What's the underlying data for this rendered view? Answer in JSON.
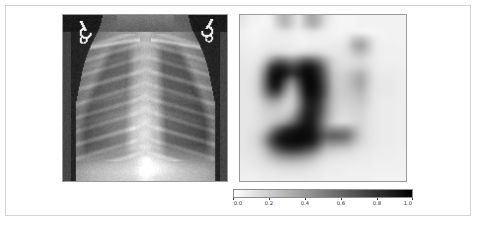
{
  "figure": {
    "background_color": "#ffffff",
    "frame_color": "#d3d3d3",
    "width": 477,
    "height": 226
  },
  "panels": {
    "left": {
      "name": "chest-xray-image",
      "kind": "grayscale-radiograph",
      "description": "Pediatric frontal chest radiograph showing rib cage, lungs and mediastinum with two metallic ECG lead clips at the upper corners",
      "border_color": "#9a9a9a"
    },
    "right": {
      "name": "saliency-heatmap-image",
      "kind": "low-resolution-grayscale-heatmap",
      "description": "Coarse pixelated attribution / saliency map overlaying the chest region, dark pixels indicate high attribution",
      "border_color": "#9a9a9a"
    }
  },
  "chart_data": {
    "type": "heatmap",
    "title": "",
    "xlabel": "",
    "ylabel": "",
    "colormap": "gray_r",
    "colormap_low_color": "#ffffff",
    "colormap_high_color": "#000000",
    "vmin": 0.0,
    "vmax": 1.0,
    "grid": false,
    "legend_position": "below-right-panel",
    "colorbar": {
      "orientation": "horizontal",
      "ticks": [
        0.0,
        0.2,
        0.4,
        0.6,
        0.8,
        1.0
      ],
      "tick_labels": [
        "0.0",
        "0.2",
        "0.4",
        "0.6",
        "0.8",
        "1.0"
      ],
      "label": ""
    },
    "heatmap_grid_size": [
      24,
      24
    ],
    "heatmap_values": [
      [
        0.1,
        0.06,
        0.05,
        0.04,
        0.07,
        0.22,
        0.3,
        0.2,
        0.1,
        0.25,
        0.34,
        0.26,
        0.12,
        0.06,
        0.04,
        0.04,
        0.04,
        0.05,
        0.05,
        0.05,
        0.05,
        0.05,
        0.05,
        0.05
      ],
      [
        0.08,
        0.05,
        0.04,
        0.04,
        0.06,
        0.18,
        0.26,
        0.18,
        0.1,
        0.22,
        0.3,
        0.22,
        0.1,
        0.05,
        0.04,
        0.04,
        0.04,
        0.05,
        0.05,
        0.05,
        0.05,
        0.05,
        0.05,
        0.05
      ],
      [
        0.06,
        0.04,
        0.04,
        0.05,
        0.06,
        0.08,
        0.1,
        0.08,
        0.06,
        0.08,
        0.1,
        0.08,
        0.06,
        0.05,
        0.04,
        0.05,
        0.06,
        0.05,
        0.04,
        0.04,
        0.04,
        0.05,
        0.05,
        0.05
      ],
      [
        0.06,
        0.05,
        0.05,
        0.06,
        0.07,
        0.07,
        0.07,
        0.06,
        0.05,
        0.05,
        0.06,
        0.06,
        0.06,
        0.06,
        0.06,
        0.1,
        0.22,
        0.26,
        0.18,
        0.08,
        0.05,
        0.05,
        0.05,
        0.05
      ],
      [
        0.07,
        0.06,
        0.06,
        0.07,
        0.08,
        0.08,
        0.08,
        0.07,
        0.06,
        0.06,
        0.07,
        0.07,
        0.07,
        0.08,
        0.09,
        0.14,
        0.3,
        0.36,
        0.24,
        0.1,
        0.06,
        0.06,
        0.06,
        0.05
      ],
      [
        0.08,
        0.07,
        0.07,
        0.1,
        0.14,
        0.16,
        0.14,
        0.12,
        0.14,
        0.18,
        0.18,
        0.16,
        0.12,
        0.1,
        0.1,
        0.12,
        0.22,
        0.26,
        0.18,
        0.09,
        0.06,
        0.06,
        0.06,
        0.06
      ],
      [
        0.09,
        0.08,
        0.1,
        0.2,
        0.4,
        0.54,
        0.52,
        0.46,
        0.52,
        0.62,
        0.6,
        0.48,
        0.3,
        0.16,
        0.12,
        0.12,
        0.14,
        0.16,
        0.12,
        0.08,
        0.06,
        0.06,
        0.06,
        0.06
      ],
      [
        0.09,
        0.09,
        0.14,
        0.36,
        0.72,
        0.86,
        0.82,
        0.74,
        0.8,
        0.9,
        0.88,
        0.72,
        0.44,
        0.2,
        0.14,
        0.14,
        0.16,
        0.18,
        0.14,
        0.09,
        0.07,
        0.07,
        0.07,
        0.06
      ],
      [
        0.1,
        0.1,
        0.18,
        0.48,
        0.86,
        0.95,
        0.9,
        0.8,
        0.88,
        0.96,
        0.94,
        0.8,
        0.52,
        0.24,
        0.18,
        0.2,
        0.26,
        0.3,
        0.2,
        0.1,
        0.08,
        0.08,
        0.08,
        0.07
      ],
      [
        0.1,
        0.11,
        0.2,
        0.52,
        0.88,
        0.94,
        0.72,
        0.52,
        0.74,
        0.95,
        0.96,
        0.84,
        0.56,
        0.26,
        0.2,
        0.22,
        0.3,
        0.34,
        0.22,
        0.11,
        0.09,
        0.09,
        0.08,
        0.07
      ],
      [
        0.1,
        0.11,
        0.2,
        0.5,
        0.82,
        0.86,
        0.54,
        0.34,
        0.62,
        0.92,
        0.96,
        0.86,
        0.58,
        0.28,
        0.2,
        0.22,
        0.28,
        0.32,
        0.2,
        0.11,
        0.09,
        0.09,
        0.08,
        0.07
      ],
      [
        0.1,
        0.11,
        0.18,
        0.4,
        0.62,
        0.62,
        0.36,
        0.24,
        0.52,
        0.88,
        0.94,
        0.84,
        0.56,
        0.28,
        0.2,
        0.2,
        0.24,
        0.26,
        0.18,
        0.1,
        0.09,
        0.09,
        0.08,
        0.07
      ],
      [
        0.1,
        0.1,
        0.14,
        0.26,
        0.36,
        0.34,
        0.22,
        0.2,
        0.46,
        0.82,
        0.9,
        0.78,
        0.5,
        0.26,
        0.18,
        0.18,
        0.2,
        0.22,
        0.16,
        0.1,
        0.08,
        0.08,
        0.08,
        0.07
      ],
      [
        0.1,
        0.1,
        0.12,
        0.18,
        0.22,
        0.22,
        0.18,
        0.22,
        0.5,
        0.82,
        0.88,
        0.74,
        0.46,
        0.24,
        0.16,
        0.16,
        0.18,
        0.18,
        0.14,
        0.09,
        0.08,
        0.08,
        0.07,
        0.07
      ],
      [
        0.1,
        0.1,
        0.12,
        0.16,
        0.18,
        0.2,
        0.22,
        0.34,
        0.62,
        0.86,
        0.88,
        0.7,
        0.42,
        0.22,
        0.15,
        0.14,
        0.16,
        0.16,
        0.12,
        0.09,
        0.08,
        0.08,
        0.07,
        0.07
      ],
      [
        0.1,
        0.1,
        0.12,
        0.16,
        0.22,
        0.3,
        0.4,
        0.56,
        0.76,
        0.9,
        0.88,
        0.66,
        0.38,
        0.2,
        0.14,
        0.14,
        0.16,
        0.16,
        0.12,
        0.09,
        0.08,
        0.08,
        0.07,
        0.07
      ],
      [
        0.1,
        0.11,
        0.14,
        0.22,
        0.4,
        0.62,
        0.78,
        0.86,
        0.92,
        0.94,
        0.9,
        0.7,
        0.5,
        0.44,
        0.42,
        0.4,
        0.3,
        0.18,
        0.12,
        0.09,
        0.08,
        0.08,
        0.07,
        0.07
      ],
      [
        0.1,
        0.12,
        0.18,
        0.34,
        0.62,
        0.84,
        0.92,
        0.94,
        0.96,
        0.96,
        0.92,
        0.76,
        0.62,
        0.62,
        0.6,
        0.54,
        0.36,
        0.2,
        0.12,
        0.09,
        0.08,
        0.08,
        0.07,
        0.07
      ],
      [
        0.1,
        0.12,
        0.18,
        0.36,
        0.64,
        0.84,
        0.92,
        0.94,
        0.94,
        0.92,
        0.86,
        0.66,
        0.46,
        0.44,
        0.42,
        0.38,
        0.26,
        0.16,
        0.11,
        0.09,
        0.08,
        0.08,
        0.07,
        0.07
      ],
      [
        0.1,
        0.11,
        0.15,
        0.26,
        0.46,
        0.64,
        0.74,
        0.78,
        0.76,
        0.7,
        0.6,
        0.42,
        0.26,
        0.22,
        0.2,
        0.18,
        0.14,
        0.11,
        0.09,
        0.08,
        0.07,
        0.07,
        0.07,
        0.06
      ],
      [
        0.09,
        0.1,
        0.12,
        0.18,
        0.28,
        0.38,
        0.44,
        0.46,
        0.44,
        0.4,
        0.32,
        0.22,
        0.14,
        0.12,
        0.11,
        0.1,
        0.09,
        0.08,
        0.08,
        0.07,
        0.07,
        0.07,
        0.06,
        0.06
      ],
      [
        0.08,
        0.09,
        0.1,
        0.12,
        0.16,
        0.2,
        0.22,
        0.24,
        0.22,
        0.2,
        0.16,
        0.12,
        0.09,
        0.08,
        0.08,
        0.08,
        0.07,
        0.07,
        0.07,
        0.06,
        0.06,
        0.06,
        0.06,
        0.06
      ],
      [
        0.07,
        0.07,
        0.08,
        0.09,
        0.1,
        0.11,
        0.12,
        0.12,
        0.12,
        0.11,
        0.1,
        0.08,
        0.07,
        0.07,
        0.07,
        0.06,
        0.06,
        0.06,
        0.06,
        0.06,
        0.06,
        0.06,
        0.06,
        0.05
      ],
      [
        0.06,
        0.06,
        0.06,
        0.07,
        0.07,
        0.08,
        0.08,
        0.08,
        0.08,
        0.08,
        0.07,
        0.07,
        0.06,
        0.06,
        0.06,
        0.06,
        0.06,
        0.06,
        0.06,
        0.05,
        0.05,
        0.05,
        0.05,
        0.05
      ]
    ]
  }
}
